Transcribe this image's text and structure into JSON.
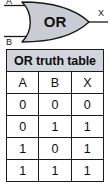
{
  "diagram": {
    "gate_label": "OR",
    "inputs": [
      {
        "name": "input-a",
        "label": "A"
      },
      {
        "name": "input-b",
        "label": "B"
      }
    ],
    "output": {
      "name": "output-x",
      "label": "X"
    },
    "colors": {
      "gate_fill": "#c9ccd4",
      "gate_stroke": "#1a1a1a",
      "wire": "#1a1a1a"
    }
  },
  "truth_table": {
    "title": "OR truth table",
    "columns": [
      "A",
      "B",
      "X"
    ],
    "rows": [
      [
        "0",
        "0",
        "0"
      ],
      [
        "0",
        "1",
        "1"
      ],
      [
        "1",
        "0",
        "1"
      ],
      [
        "1",
        "1",
        "1"
      ]
    ],
    "colors": {
      "title_bg": "#d2d5dd",
      "cell_bg": "#ffffff",
      "border": "#1a1a1a"
    }
  }
}
